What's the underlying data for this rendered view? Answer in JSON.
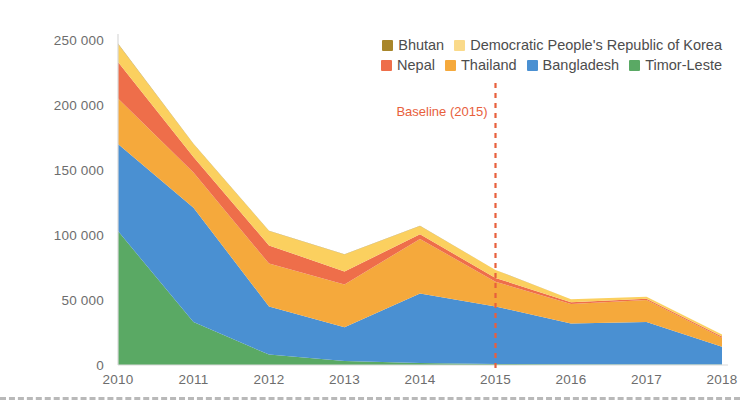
{
  "chart_data": {
    "type": "area",
    "stacked": true,
    "title": "",
    "subtitle": "",
    "xlabel": "",
    "ylabel": "",
    "x": [
      2010,
      2011,
      2012,
      2013,
      2014,
      2015,
      2016,
      2017,
      2018
    ],
    "categories": [
      "2010",
      "2011",
      "2012",
      "2013",
      "2014",
      "2015",
      "2016",
      "2017",
      "2018"
    ],
    "xtick_labels": [
      "2010",
      "2011",
      "2012",
      "2013",
      "2014",
      "2015",
      "2016",
      "2017",
      "2018"
    ],
    "ytick_values": [
      0,
      50000,
      100000,
      150000,
      200000,
      250000
    ],
    "ytick_labels": [
      "0",
      "50 000",
      "100 000",
      "150 000",
      "200 000",
      "250 000"
    ],
    "ylim": [
      0,
      250000
    ],
    "xlim": [
      2010,
      2018
    ],
    "grid": false,
    "legend_position": "top-right",
    "series": [
      {
        "name": "Timor-Leste",
        "color": "#5aa964",
        "values": [
          103000,
          33000,
          8000,
          3000,
          1500,
          800,
          500,
          400,
          300
        ]
      },
      {
        "name": "Bangladesh",
        "color": "#4a90d2",
        "values": [
          67000,
          88000,
          37000,
          26000,
          53500,
          44200,
          31500,
          32600,
          13700
        ]
      },
      {
        "name": "Thailand",
        "color": "#f5a93c",
        "values": [
          35000,
          27000,
          33000,
          33000,
          42000,
          19000,
          15000,
          17000,
          7000
        ]
      },
      {
        "name": "Nepal",
        "color": "#ee6e4a",
        "values": [
          28000,
          12000,
          14000,
          10000,
          3500,
          3000,
          1200,
          900,
          900
        ]
      },
      {
        "name": "Democratic People's Republic of Korea",
        "color": "#fbd05f",
        "values": [
          14000,
          10000,
          11000,
          13000,
          6500,
          6000,
          2300,
          1600,
          1600
        ]
      },
      {
        "name": "Bhutan",
        "color": "#a8862a",
        "values": [
          300,
          250,
          200,
          150,
          120,
          100,
          80,
          60,
          50
        ]
      }
    ],
    "totals": [
      247300,
      170250,
      103200,
      85150,
      106620,
      73100,
      50580,
      52560,
      23550
    ],
    "annotations": [
      {
        "name": "baseline",
        "label": "Baseline (2015)",
        "x": 2015,
        "color": "#e8603c",
        "style": "dashed-vertical"
      }
    ]
  },
  "legend": {
    "rows": [
      [
        {
          "label": "Bhutan",
          "color": "#a8862a"
        },
        {
          "label": "Democratic People's Republic of Korea",
          "color": "#fada8a"
        }
      ],
      [
        {
          "label": "Nepal",
          "color": "#ee6e4a"
        },
        {
          "label": "Thailand",
          "color": "#f5a93c"
        },
        {
          "label": "Bangladesh",
          "color": "#4a90d2"
        },
        {
          "label": "Timor-Leste",
          "color": "#5aa964"
        }
      ]
    ]
  },
  "colors": {
    "timor_leste": "#5aa964",
    "bangladesh": "#4a90d2",
    "thailand": "#f5a93c",
    "nepal": "#ee6e4a",
    "dprk": "#fbd05f",
    "bhutan": "#a8862a",
    "baseline": "#e8603c",
    "axis": "#d9d9d9",
    "tick_text": "#6d6d6d",
    "legend_text": "#4d4d4d",
    "background": "#ffffff"
  }
}
